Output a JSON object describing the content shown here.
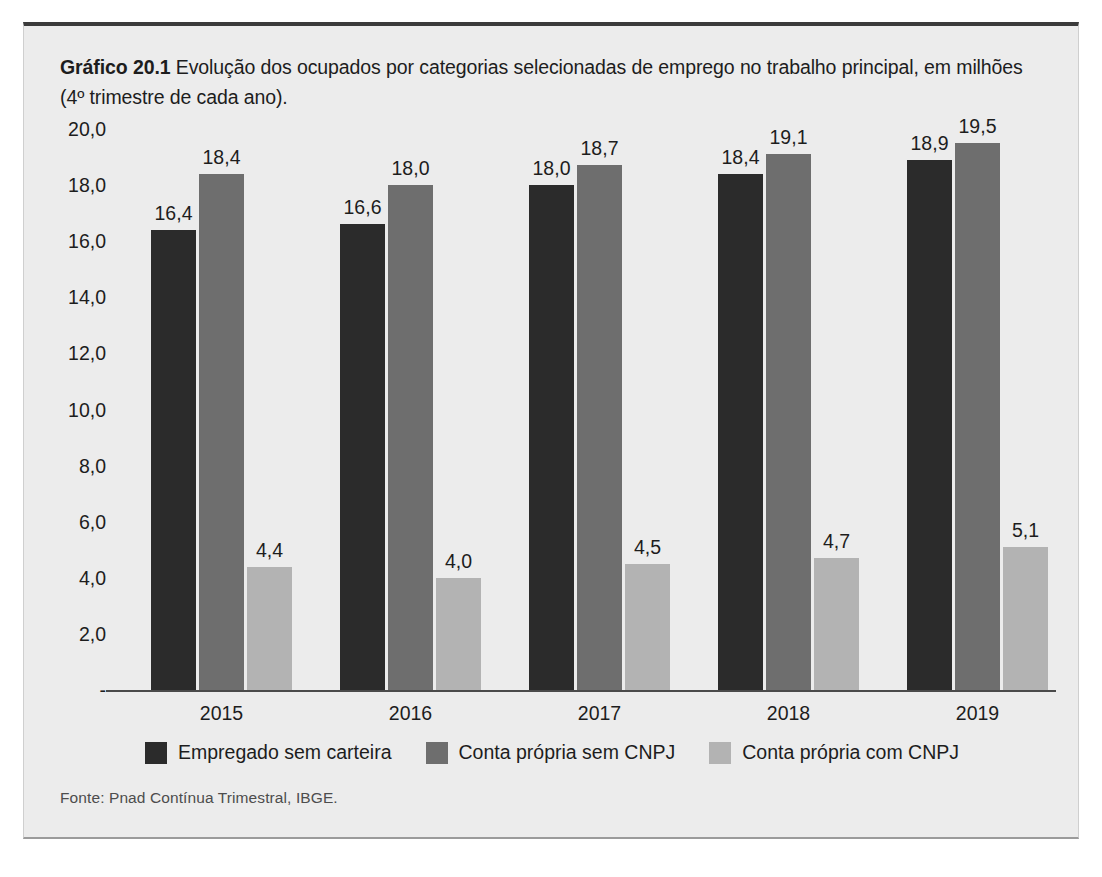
{
  "caption": {
    "number": "Gráfico 20.1",
    "text": " Evolução dos ocupados por categorias selecionadas de emprego no trabalho principal, em milhões (4º trimestre de cada ano)."
  },
  "source": "Fonte: Pnad Contínua Trimestral, IBGE.",
  "colors": {
    "series1": "#2b2b2b",
    "series2": "#6e6e6e",
    "series3": "#b3b3b3",
    "axis": "#4a4a4a",
    "panel_background": "#ececec",
    "text": "#1d1d1d"
  },
  "chart_data": {
    "type": "bar",
    "title": "Gráfico 20.1 Evolução dos ocupados por categorias selecionadas de emprego no trabalho principal, em milhões (4º trimestre de cada ano).",
    "xlabel": "",
    "ylabel": "",
    "grid": false,
    "legend_position": "bottom",
    "ylim": [
      0,
      20
    ],
    "ytick_labels": [
      "20,0",
      "18,0",
      "16,0",
      "14,0",
      "12,0",
      "10,0",
      "8,0",
      "6,0",
      "4,0",
      "2,0",
      "-"
    ],
    "ytick_values": [
      20,
      18,
      16,
      14,
      12,
      10,
      8,
      6,
      4,
      2,
      0
    ],
    "categories": [
      "2015",
      "2016",
      "2017",
      "2018",
      "2019"
    ],
    "series": [
      {
        "name": "Empregado sem carteira",
        "color": "#2b2b2b",
        "values": [
          16.4,
          16.6,
          18.0,
          18.4,
          18.9
        ],
        "labels": [
          "16,4",
          "16,6",
          "18,0",
          "18,4",
          "18,9"
        ]
      },
      {
        "name": "Conta própria sem CNPJ",
        "color": "#6e6e6e",
        "values": [
          18.4,
          18.0,
          18.7,
          19.1,
          19.5
        ],
        "labels": [
          "18,4",
          "18,0",
          "18,7",
          "19,1",
          "19,5"
        ]
      },
      {
        "name": "Conta própria com CNPJ",
        "color": "#b3b3b3",
        "values": [
          4.4,
          4.0,
          4.5,
          4.7,
          5.1
        ],
        "labels": [
          "4,4",
          "4,0",
          "4,5",
          "4,7",
          "5,1"
        ]
      }
    ]
  }
}
